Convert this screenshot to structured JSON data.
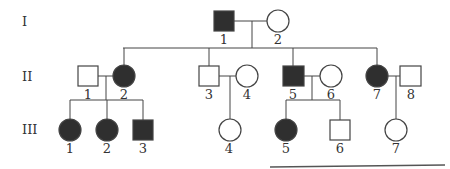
{
  "diagram": {
    "type": "pedigree-chart",
    "colors": {
      "affected": "#2f2f2f",
      "unaffected": "#ffffff",
      "stroke": "#444444"
    },
    "generations": [
      {
        "label": "I"
      },
      {
        "label": "II"
      },
      {
        "label": "III"
      }
    ],
    "individuals": {
      "I": [
        {
          "id": "1",
          "sex": "male",
          "affected": true
        },
        {
          "id": "2",
          "sex": "female",
          "affected": false
        }
      ],
      "II": [
        {
          "id": "1",
          "sex": "male",
          "affected": false
        },
        {
          "id": "2",
          "sex": "female",
          "affected": true
        },
        {
          "id": "3",
          "sex": "male",
          "affected": false
        },
        {
          "id": "4",
          "sex": "female",
          "affected": false
        },
        {
          "id": "5",
          "sex": "male",
          "affected": true
        },
        {
          "id": "6",
          "sex": "female",
          "affected": false
        },
        {
          "id": "7",
          "sex": "female",
          "affected": true
        },
        {
          "id": "8",
          "sex": "male",
          "affected": false
        }
      ],
      "III": [
        {
          "id": "1",
          "sex": "female",
          "affected": true
        },
        {
          "id": "2",
          "sex": "female",
          "affected": true
        },
        {
          "id": "3",
          "sex": "male",
          "affected": true
        },
        {
          "id": "4",
          "sex": "female",
          "affected": false
        },
        {
          "id": "5",
          "sex": "female",
          "affected": true
        },
        {
          "id": "6",
          "sex": "male",
          "affected": false
        },
        {
          "id": "7",
          "sex": "female",
          "affected": false
        }
      ]
    }
  }
}
